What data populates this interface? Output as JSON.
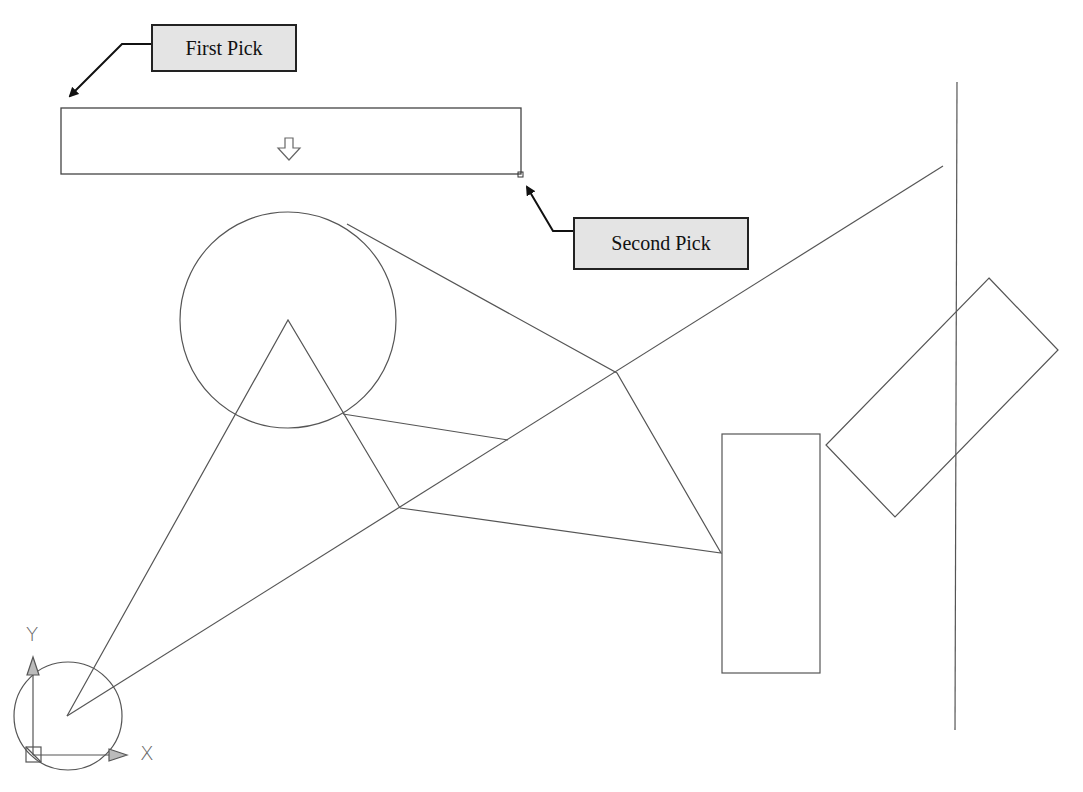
{
  "callouts": {
    "first_pick": {
      "label": "First Pick"
    },
    "second_pick": {
      "label": "Second Pick"
    }
  },
  "ucs_icon": {
    "x_label": "X",
    "y_label": "Y"
  },
  "selection_window": {
    "cursor_icon": "down-arrow-outline",
    "grip": "small-square"
  },
  "colors": {
    "line": "#555555",
    "callout_fill": "#e4e4e4",
    "callout_border": "#222222",
    "background": "#ffffff"
  },
  "drawing_entities": [
    {
      "type": "line",
      "name": "vertical-line"
    },
    {
      "type": "line",
      "name": "long-diagonal-line"
    },
    {
      "type": "circle",
      "name": "upper-circle"
    },
    {
      "type": "circle",
      "name": "origin-circle"
    },
    {
      "type": "polyline",
      "name": "triangle-polyline"
    },
    {
      "type": "polyline",
      "name": "quadrilateral-polyline"
    },
    {
      "type": "rectangle",
      "name": "vertical-rectangle"
    },
    {
      "type": "rectangle",
      "name": "rotated-rectangle"
    }
  ]
}
